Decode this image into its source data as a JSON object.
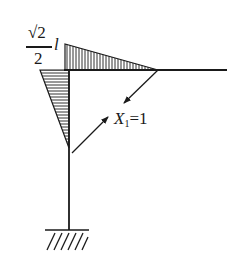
{
  "diagram": {
    "type": "structural-frame-moment-diagram",
    "moment_label": {
      "numerator": "√2",
      "denominator": "2",
      "variable": "l"
    },
    "force_label": {
      "variable": "X",
      "subscript": "1",
      "equals": "=1"
    },
    "colors": {
      "line": "#1a1a1a",
      "background": "#ffffff"
    }
  }
}
